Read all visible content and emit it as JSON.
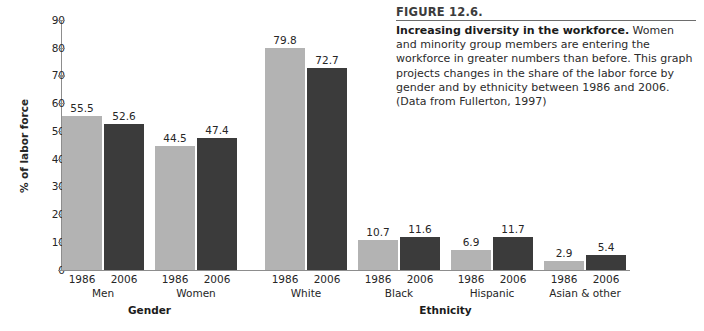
{
  "figure": {
    "number": "FIGURE 12.6.",
    "lead": "Increasing diversity in the workforce.",
    "body": " Women and minority group members are entering the workforce in greater numbers than before. This graph projects changes in the share of the labor force by gender and by ethnicity between 1986 and 2006. (Data from Fullerton, 1997)"
  },
  "chart_data": {
    "type": "bar",
    "title": "Increasing diversity in the workforce.",
    "xlabel": "",
    "ylabel": "% of labor force",
    "ylim": [
      0,
      90
    ],
    "yticks": [
      "0",
      "10",
      "20",
      "30",
      "40",
      "50",
      "60",
      "70",
      "80",
      "90"
    ],
    "grid": false,
    "legend": "none",
    "series": [
      {
        "name": "1986",
        "color": "#b3b3b3",
        "values": [
          55.5,
          44.5,
          79.8,
          10.7,
          6.9,
          2.9
        ]
      },
      {
        "name": "2006",
        "color": "#3b3b3b",
        "values": [
          52.6,
          47.4,
          72.7,
          11.6,
          11.7,
          5.4
        ]
      }
    ],
    "categories": [
      "Men",
      "Women",
      "White",
      "Black",
      "Hispanic",
      "Asian & other"
    ],
    "supergroups": [
      {
        "label": "Gender",
        "categories": [
          "Men",
          "Women"
        ]
      },
      {
        "label": "Ethnicity",
        "categories": [
          "White",
          "Black",
          "Hispanic",
          "Asian & other"
        ]
      }
    ],
    "bars": [
      {
        "group": "Men",
        "year": "1986",
        "value": 55.5,
        "value_label": "55.5",
        "series": "1986"
      },
      {
        "group": "Men",
        "year": "2006",
        "value": 52.6,
        "value_label": "52.6",
        "series": "2006"
      },
      {
        "group": "Women",
        "year": "1986",
        "value": 44.5,
        "value_label": "44.5",
        "series": "1986"
      },
      {
        "group": "Women",
        "year": "2006",
        "value": 47.4,
        "value_label": "47.4",
        "series": "2006"
      },
      {
        "group": "White",
        "year": "1986",
        "value": 79.8,
        "value_label": "79.8",
        "series": "1986"
      },
      {
        "group": "White",
        "year": "2006",
        "value": 72.7,
        "value_label": "72.7",
        "series": "2006"
      },
      {
        "group": "Black",
        "year": "1986",
        "value": 10.7,
        "value_label": "10.7",
        "series": "1986"
      },
      {
        "group": "Black",
        "year": "2006",
        "value": 11.6,
        "value_label": "11.6",
        "series": "2006"
      },
      {
        "group": "Hispanic",
        "year": "1986",
        "value": 6.9,
        "value_label": "6.9",
        "series": "1986"
      },
      {
        "group": "Hispanic",
        "year": "2006",
        "value": 11.7,
        "value_label": "11.7",
        "series": "2006"
      },
      {
        "group": "Asian & other",
        "year": "1986",
        "value": 2.9,
        "value_label": "2.9",
        "series": "1986"
      },
      {
        "group": "Asian & other",
        "year": "2006",
        "value": 5.4,
        "value_label": "5.4",
        "series": "2006"
      }
    ]
  },
  "colors": {
    "bar_1986": "#b3b3b3",
    "bar_2006": "#3b3b3b",
    "axis": "#8d8d8d",
    "text": "#262626",
    "rule": "#6d6d6d"
  }
}
